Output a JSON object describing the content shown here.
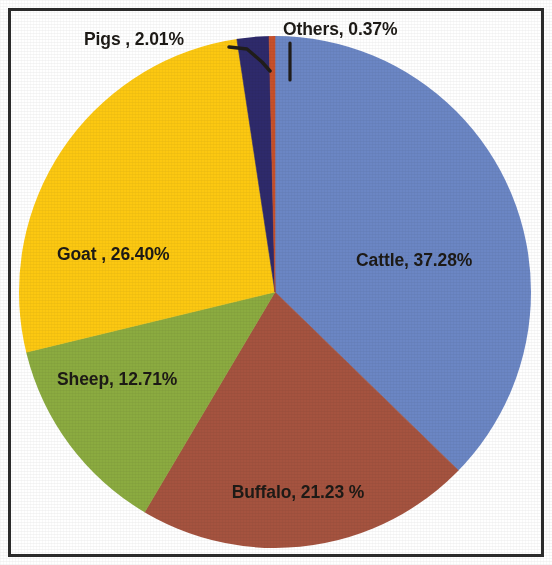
{
  "chart_data": {
    "type": "pie",
    "title": "",
    "subtitle": "",
    "xlabel": "",
    "ylabel": "",
    "legend_position": "none",
    "grid": false,
    "labels_inside": true,
    "categories": [
      "Cattle",
      "Buffalo",
      "Sheep",
      "Goat",
      "Pigs",
      "Others"
    ],
    "values": [
      37.28,
      21.23,
      12.71,
      26.4,
      2.01,
      0.37
    ],
    "value_unit": "%",
    "start_angle_deg": 0,
    "direction": "clockwise",
    "slices": [
      {
        "name": "Cattle",
        "value": 37.28,
        "label": "Cattle, 37.28%",
        "color": "#6b86c4",
        "label_color": "#1d1a16"
      },
      {
        "name": "Buffalo",
        "value": 21.23,
        "label": "Buffalo, 21.23 %",
        "color": "#a5533f",
        "label_color": "#1d1a16"
      },
      {
        "name": "Sheep",
        "value": 12.71,
        "label": "Sheep, 12.71%",
        "color": "#8bab40",
        "label_color": "#1d1a16"
      },
      {
        "name": "Goat",
        "value": 26.4,
        "label": "Goat , 26.40%",
        "color": "#fcc811",
        "label_color": "#1d1a16"
      },
      {
        "name": "Pigs",
        "value": 2.01,
        "label": "Pigs , 2.01%",
        "color": "#2e2a6b",
        "label_color": "#1d1a16"
      },
      {
        "name": "Others",
        "value": 0.37,
        "label": "Others, 0.37%",
        "color": "#c8502a",
        "label_color": "#1d1a16"
      }
    ]
  },
  "labels": {
    "cattle": "Cattle, 37.28%",
    "buffalo": "Buffalo, 21.23 %",
    "sheep": "Sheep, 12.71%",
    "goat": "Goat , 26.40%",
    "pigs": "Pigs , 2.01%",
    "others": "Others, 0.37%"
  },
  "colors": {
    "cattle": "#6b86c4",
    "buffalo": "#a5533f",
    "sheep": "#8bab40",
    "goat": "#fcc811",
    "pigs": "#2e2a6b",
    "others": "#c8502a",
    "border": "#2b2b2b",
    "background": "#ffffff",
    "label_text": "#1d1a16"
  }
}
